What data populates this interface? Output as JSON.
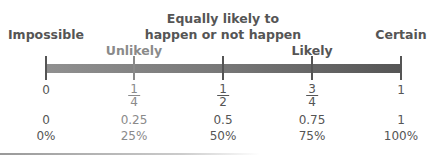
{
  "labels": {
    "impossible": "Impossible",
    "unlikely": "Unlikely",
    "equally_line1": "Equally likely to",
    "equally_line2": "happen or not happen",
    "likely": "Likely",
    "certain": "Certain"
  },
  "scale": {
    "fractions": [
      {
        "whole": "0"
      },
      {
        "num": "1",
        "den": "4"
      },
      {
        "num": "1",
        "den": "2"
      },
      {
        "num": "3",
        "den": "4"
      },
      {
        "whole": "1"
      }
    ],
    "decimals": [
      "0",
      "0.25",
      "0.5",
      "0.75",
      "1"
    ],
    "percents": [
      "0%",
      "25%",
      "50%",
      "75%",
      "100%"
    ]
  },
  "colors": {
    "dark": "#555555",
    "light": "#8a8a8a"
  }
}
